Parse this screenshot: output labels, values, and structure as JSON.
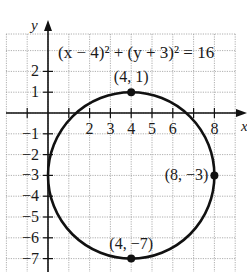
{
  "chart_data": {
    "type": "line",
    "title": "",
    "equation": "(x − 4)² + (y + 3)² = 16",
    "xlabel": "x",
    "ylabel": "y",
    "xlim": [
      -1.9,
      9.3
    ],
    "ylim": [
      -7.6,
      3.9
    ],
    "grid": true,
    "x_ticks": [
      -1,
      1,
      2,
      3,
      4,
      5,
      6,
      7,
      8
    ],
    "x_tick_labels": [
      "2",
      "3",
      "4",
      "5",
      "6",
      "8"
    ],
    "x_tick_label_values": [
      2,
      3,
      4,
      5,
      6,
      8
    ],
    "y_ticks": [
      2,
      1,
      -1,
      -2,
      -3,
      -4,
      -5,
      -6,
      -7
    ],
    "y_tick_labels": [
      "2",
      "1",
      "−1",
      "−2",
      "−3",
      "−4",
      "−5",
      "−6",
      "−7"
    ],
    "circle": {
      "center": [
        4,
        -3
      ],
      "radius": 4
    },
    "points": [
      {
        "label": "(4, 1)",
        "x": 4,
        "y": 1
      },
      {
        "label": "(8, −3)",
        "x": 8,
        "y": -3
      },
      {
        "label": "(4, −7)",
        "x": 4,
        "y": -7
      }
    ]
  }
}
